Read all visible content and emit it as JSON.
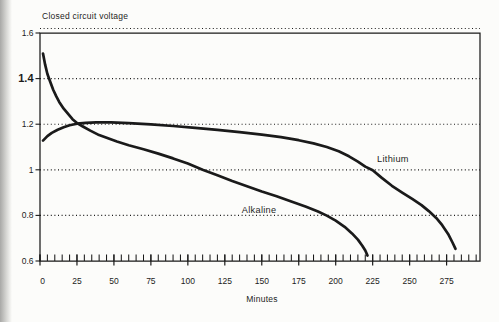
{
  "page": {
    "background": "#fcfcfa",
    "ink": "#1a1a1a",
    "scan_edge_color": "#a8a8a6"
  },
  "chart_data": {
    "type": "line",
    "title": "Closed circuit voltage",
    "xlabel": "Minutes",
    "ylabel": "Closed circuit voltage",
    "x_unit": "minutes",
    "y_unit": "volts",
    "xlim": [
      0,
      297.6
    ],
    "ylim": [
      0.6,
      1.6
    ],
    "x_major_ticks": [
      0,
      25,
      50,
      75,
      100,
      125,
      150,
      175,
      200,
      225,
      250,
      275
    ],
    "x_minor_step": 5,
    "x_minor_range": [
      0,
      295
    ],
    "y_ticks": [
      {
        "v": 1.6,
        "label": "1.6",
        "bold": false
      },
      {
        "v": 1.4,
        "label": "1.4",
        "bold": true
      },
      {
        "v": 1.2,
        "label": "1.2",
        "bold": false
      },
      {
        "v": 1.0,
        "label": "1",
        "bold": false
      },
      {
        "v": 0.8,
        "label": "0.8",
        "bold": false
      },
      {
        "v": 0.6,
        "label": "0.6",
        "bold": false
      }
    ],
    "gridlines_y": [
      1.4,
      1.2,
      1.0,
      0.8
    ],
    "grid_style": "dotted",
    "top_border_dotted": true,
    "legend_position": "inline-labels",
    "series": [
      {
        "name": "Alkaline",
        "label_anchor": {
          "min": 136.5,
          "v": 0.812
        },
        "points": [
          [
            2,
            1.51
          ],
          [
            3.5,
            1.46
          ],
          [
            5,
            1.42
          ],
          [
            7,
            1.385
          ],
          [
            9,
            1.35
          ],
          [
            11,
            1.322
          ],
          [
            13,
            1.298
          ],
          [
            16,
            1.268
          ],
          [
            19,
            1.245
          ],
          [
            22,
            1.222
          ],
          [
            25,
            1.205
          ],
          [
            29,
            1.19
          ],
          [
            34,
            1.172
          ],
          [
            40,
            1.152
          ],
          [
            46,
            1.138
          ],
          [
            52,
            1.124
          ],
          [
            60,
            1.108
          ],
          [
            70,
            1.09
          ],
          [
            80,
            1.071
          ],
          [
            90,
            1.05
          ],
          [
            100,
            1.027
          ],
          [
            110,
            1.0
          ],
          [
            120,
            0.976
          ],
          [
            130,
            0.951
          ],
          [
            140,
            0.928
          ],
          [
            150,
            0.905
          ],
          [
            160,
            0.884
          ],
          [
            170,
            0.861
          ],
          [
            180,
            0.838
          ],
          [
            188,
            0.817
          ],
          [
            194,
            0.799
          ],
          [
            200,
            0.777
          ],
          [
            206,
            0.75
          ],
          [
            211,
            0.721
          ],
          [
            215,
            0.694
          ],
          [
            218,
            0.667
          ],
          [
            220,
            0.646
          ],
          [
            221.5,
            0.624
          ]
        ]
      },
      {
        "name": "Lithium",
        "label_anchor": {
          "min": 228,
          "v": 1.035
        },
        "points": [
          [
            2,
            1.128
          ],
          [
            5,
            1.148
          ],
          [
            8,
            1.162
          ],
          [
            12,
            1.176
          ],
          [
            16,
            1.187
          ],
          [
            20,
            1.195
          ],
          [
            25,
            1.202
          ],
          [
            31,
            1.206
          ],
          [
            38,
            1.208
          ],
          [
            48,
            1.208
          ],
          [
            60,
            1.205
          ],
          [
            75,
            1.199
          ],
          [
            90,
            1.192
          ],
          [
            105,
            1.184
          ],
          [
            120,
            1.175
          ],
          [
            135,
            1.165
          ],
          [
            150,
            1.154
          ],
          [
            163,
            1.143
          ],
          [
            175,
            1.13
          ],
          [
            185,
            1.116
          ],
          [
            194,
            1.1
          ],
          [
            202,
            1.081
          ],
          [
            209,
            1.059
          ],
          [
            215,
            1.036
          ],
          [
            220,
            1.014
          ],
          [
            225,
            0.998
          ],
          [
            231,
            0.966
          ],
          [
            238,
            0.93
          ],
          [
            245,
            0.9
          ],
          [
            252,
            0.871
          ],
          [
            258,
            0.845
          ],
          [
            263,
            0.819
          ],
          [
            268,
            0.789
          ],
          [
            272,
            0.757
          ],
          [
            276,
            0.719
          ],
          [
            279,
            0.681
          ],
          [
            281,
            0.653
          ]
        ]
      }
    ]
  }
}
